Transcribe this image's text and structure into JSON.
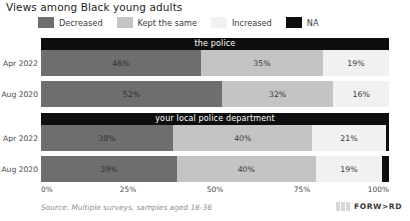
{
  "title": "Views among Black young adults",
  "legend": {
    "position": "top",
    "items": [
      {
        "label": "Decreased",
        "color": "#6e6e6e",
        "icon": "legend-swatch"
      },
      {
        "label": "Kept the same",
        "color": "#c4c4c4",
        "icon": "legend-swatch"
      },
      {
        "label": "Increased",
        "color": "#f1f1f1",
        "icon": "legend-swatch"
      },
      {
        "label": "NA",
        "color": "#0e0e0e",
        "icon": "legend-swatch"
      }
    ]
  },
  "axis": {
    "ticks": [
      "0%",
      "25%",
      "50%",
      "75%",
      "100%"
    ]
  },
  "panels": [
    {
      "title": "the police",
      "rows": [
        {
          "label": "Apr 2022",
          "segments": [
            {
              "series": "Decreased",
              "value": 46,
              "text": "46%"
            },
            {
              "series": "Kept the same",
              "value": 35,
              "text": "35%"
            },
            {
              "series": "Increased",
              "value": 19,
              "text": "19%"
            },
            {
              "series": "NA",
              "value": 0,
              "text": ""
            }
          ]
        },
        {
          "label": "Aug 2020",
          "segments": [
            {
              "series": "Decreased",
              "value": 52,
              "text": "52%"
            },
            {
              "series": "Kept the same",
              "value": 32,
              "text": "32%"
            },
            {
              "series": "Increased",
              "value": 16,
              "text": "16%"
            },
            {
              "series": "NA",
              "value": 1,
              "text": ""
            }
          ]
        }
      ]
    },
    {
      "title": "your local police department",
      "rows": [
        {
          "label": "Apr 2022",
          "segments": [
            {
              "series": "Decreased",
              "value": 38,
              "text": "38%"
            },
            {
              "series": "Kept the same",
              "value": 40,
              "text": "40%"
            },
            {
              "series": "Increased",
              "value": 21,
              "text": "21%"
            },
            {
              "series": "NA",
              "value": 1,
              "text": ""
            }
          ]
        },
        {
          "label": "Aug 2020",
          "segments": [
            {
              "series": "Decreased",
              "value": 39,
              "text": "39%"
            },
            {
              "series": "Kept the same",
              "value": 40,
              "text": "40%"
            },
            {
              "series": "Increased",
              "value": 19,
              "text": "19%"
            },
            {
              "series": "NA",
              "value": 2,
              "text": ""
            }
          ]
        }
      ]
    }
  ],
  "source": "Source: Multiple surveys, samples aged 18-36",
  "brand": {
    "text": "FORW>RD"
  },
  "chart_data": {
    "type": "bar",
    "orientation": "horizontal",
    "stacked": true,
    "normalized": true,
    "title": "Views among Black young adults",
    "xlabel": "",
    "ylabel": "",
    "xlim": [
      0,
      100
    ],
    "xticks": [
      0,
      25,
      50,
      75,
      100
    ],
    "xticklabels": [
      "0%",
      "25%",
      "50%",
      "75%",
      "100%"
    ],
    "grid": false,
    "legend_position": "top",
    "legend_entries": [
      "Decreased",
      "Kept the same",
      "Increased",
      "NA"
    ],
    "colors": {
      "Decreased": "#6e6e6e",
      "Kept the same": "#c4c4c4",
      "Increased": "#f1f1f1",
      "NA": "#0e0e0e"
    },
    "facets": [
      "the police",
      "your local police department"
    ],
    "categories": [
      "Apr 2022",
      "Aug 2020"
    ],
    "series": [
      {
        "name": "Decreased",
        "facet_values": {
          "the police": [
            46,
            52
          ],
          "your local police department": [
            38,
            39
          ]
        }
      },
      {
        "name": "Kept the same",
        "facet_values": {
          "the police": [
            35,
            32
          ],
          "your local police department": [
            40,
            40
          ]
        }
      },
      {
        "name": "Increased",
        "facet_values": {
          "the police": [
            19,
            16
          ],
          "your local police department": [
            21,
            19
          ]
        }
      },
      {
        "name": "NA",
        "facet_values": {
          "the police": [
            0,
            1
          ],
          "your local police department": [
            1,
            2
          ]
        }
      }
    ],
    "annotations": [
      "Source: Multiple surveys, samples aged 18-36"
    ]
  }
}
